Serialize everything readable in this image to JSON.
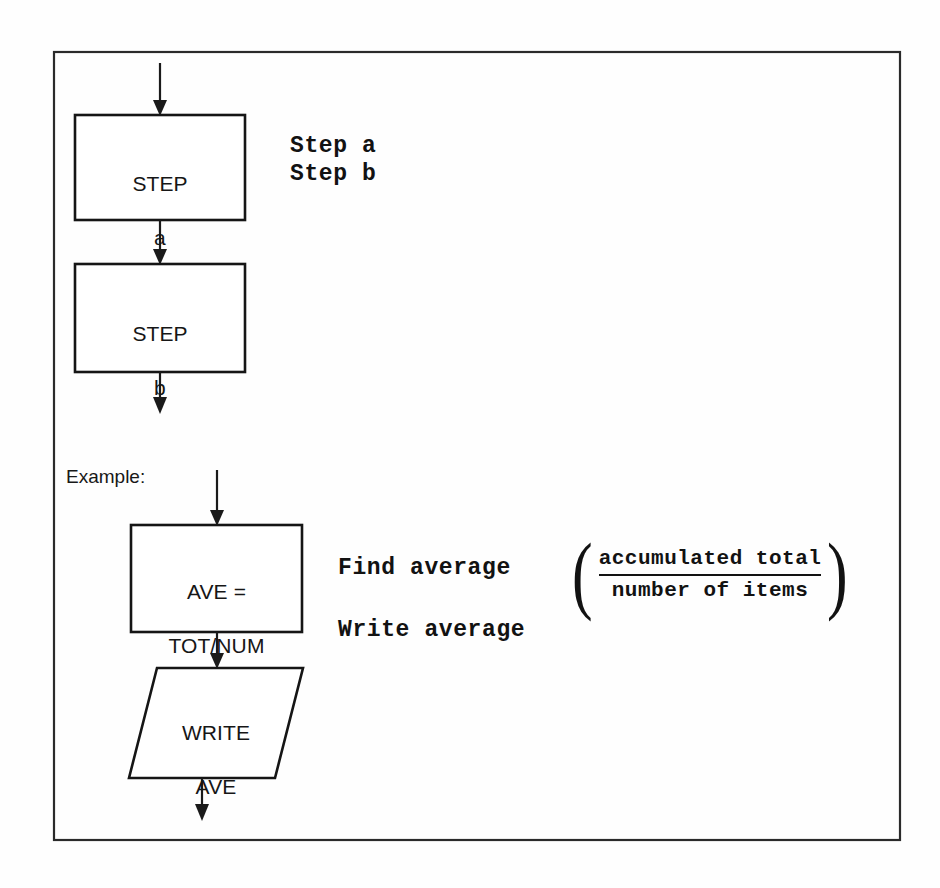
{
  "figure": {
    "kind": "flowchart",
    "background_color": "#fefefe",
    "frame_color": "#2a2a2a",
    "stroke_color": "#151515",
    "shape_fill": "#ffffff"
  },
  "generic_section": {
    "nodes": [
      {
        "id": "step-a",
        "shape": "process-rectangle",
        "line1": "STEP",
        "line2": "a"
      },
      {
        "id": "step-b",
        "shape": "process-rectangle",
        "line1": "STEP",
        "line2": "b"
      }
    ],
    "annotations": {
      "line1": "Step a",
      "line2": "Step b"
    }
  },
  "example_section": {
    "caption": "Example:",
    "nodes": [
      {
        "id": "ave-assign",
        "shape": "process-rectangle",
        "line1": "AVE =",
        "line2": "TOT/NUM"
      },
      {
        "id": "write-ave",
        "shape": "output-parallelogram",
        "line1": "WRITE",
        "line2": "AVE"
      }
    ],
    "annotations": {
      "find_average": "Find average",
      "write_average": "Write average",
      "fraction": {
        "open_paren": "(",
        "numerator": "accumulated total",
        "denominator": "number of items",
        "close_paren": ")"
      }
    }
  },
  "connectors": [
    {
      "id": "entry-to-step-a",
      "from": "top-edge",
      "to": "step-a",
      "arrowhead": "down"
    },
    {
      "id": "step-a-to-step-b",
      "from": "step-a",
      "to": "step-b",
      "arrowhead": "down"
    },
    {
      "id": "step-b-to-exit",
      "from": "step-b",
      "to": "below",
      "arrowhead": "down"
    },
    {
      "id": "entry-to-ave",
      "from": "above",
      "to": "ave-assign",
      "arrowhead": "down"
    },
    {
      "id": "ave-to-write",
      "from": "ave-assign",
      "to": "write-ave",
      "arrowhead": "down"
    },
    {
      "id": "write-to-exit",
      "from": "write-ave",
      "to": "below",
      "arrowhead": "down"
    }
  ]
}
